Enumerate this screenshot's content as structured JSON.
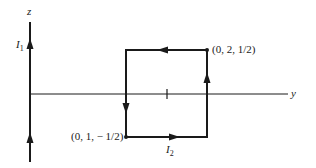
{
  "diagram": {
    "type": "current-loop-and-wire",
    "axes": {
      "z": {
        "label": "z"
      },
      "y": {
        "label": "y"
      }
    },
    "wire": {
      "current_label": "I",
      "current_subscript": "1",
      "direction": "up (+z)"
    },
    "loop": {
      "current_label": "I",
      "current_subscript": "2",
      "direction": "right on bottom, up on right, left on top, down on left",
      "corners": [
        {
          "label": "(0, 2, 1/2)",
          "position": "top-right"
        },
        {
          "label": "(0, 1, − 1/2)",
          "position": "bottom-left"
        }
      ]
    },
    "y_tick": {
      "description": "tick mark at y = 1.5 on y-axis"
    },
    "colors": {
      "line": "#1a1a1a",
      "background": "#ffffff"
    }
  }
}
